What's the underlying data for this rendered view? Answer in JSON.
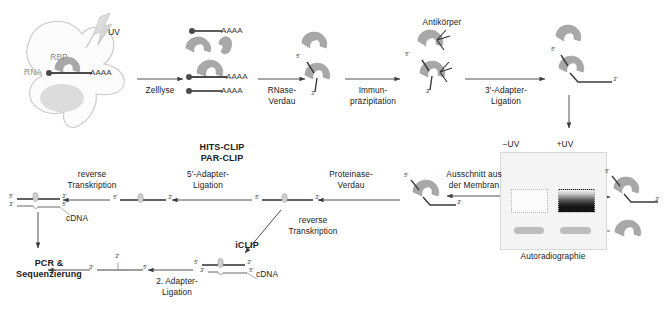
{
  "figure": {
    "language": "de"
  },
  "colors": {
    "protein_fill": "#a8a8a8",
    "protein_stroke": "#8f8f8f",
    "rna_stroke": "#4a4a4a",
    "arrow_stroke": "#3d3d3d",
    "cell_stroke": "#c9c9c9",
    "nucleus_fill": "#d8d8d8",
    "uv_fill": "#dcdcdc",
    "gel_bg": "#f4f4f4",
    "band_dark": "#111111",
    "smear_gray": "#bdbdbd",
    "text": "#202020"
  },
  "cell": {
    "rbp_label": "RBP",
    "rna_label": "RNA",
    "uv_label": "UV",
    "poly_a_label": "AAAA"
  },
  "steps": {
    "zelllyse": "Zelllyse",
    "rnase_verdau": "RNase-\nVerdau",
    "immunpraezipitation": "Immun-\npräzipitation",
    "adapter3_ligation": "3'-Adapter-\nLigation",
    "ausschnitt_membran": "Ausschnitt aus\nder Membran",
    "proteinase_verdau": "Proteinase-\nVerdau",
    "adapter5_ligation": "5'-Adapter-\nLigation",
    "reverse_transkription_top": "reverse\nTranskription",
    "reverse_transkription_iclip": "reverse\nTranskription",
    "adapter2_ligation": "2. Adapter-\nLigation"
  },
  "labels": {
    "antikoerper": "Antikörper",
    "autoradiographie": "Autoradiographie",
    "minus_uv": "−UV",
    "plus_uv": "+UV",
    "cdna_top": "cDNA",
    "cdna_iclip": "cDNA"
  },
  "method_names": {
    "hits_clip": "HITS-CLIP",
    "par_clip": "PAR-CLIP",
    "iclip": "iCLIP"
  },
  "outcome": {
    "pcr_sequenzierung": "PCR &\nSequenzierung"
  },
  "primes": {
    "five": "5'",
    "three": "3'"
  },
  "lysate": {
    "polya_1": "AAAA",
    "polya_2": "AAAA",
    "polya_3": "AAAA"
  }
}
